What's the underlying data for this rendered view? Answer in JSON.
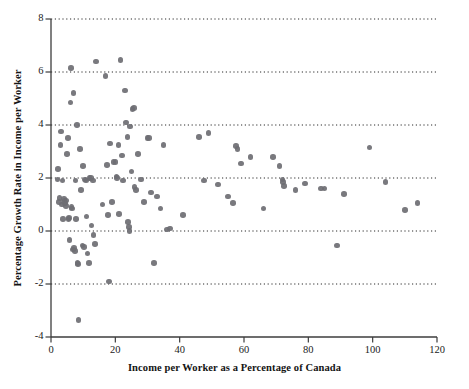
{
  "chart_data": {
    "type": "scatter",
    "title": "",
    "xlabel": "Income per Worker as a Percentage of Canada",
    "ylabel": "Percentage Growth Rate in Income per Worker",
    "xlim": [
      0,
      120
    ],
    "ylim": [
      -4,
      8
    ],
    "xticks": [
      0,
      20,
      40,
      60,
      80,
      100,
      120
    ],
    "yticks": [
      -4,
      -2,
      0,
      2,
      4,
      6,
      8
    ],
    "xtick_labels": [
      "0",
      "20",
      "40",
      "60",
      "80",
      "100",
      "120"
    ],
    "ytick_labels": [
      "-4",
      "-2",
      "0",
      "2",
      "4",
      "6",
      "8"
    ],
    "grid": "horizontal dotted gridlines at y = -2, 0, 2, 4, 6, 8",
    "gridlines": [
      -2,
      0,
      2,
      4,
      6,
      8
    ],
    "legend": null,
    "marker_color": "#6e6e73",
    "axis_color": "#3c3c3c",
    "points": [
      [
        2.0,
        1.95
      ],
      [
        2.2,
        2.35
      ],
      [
        2.5,
        1.1
      ],
      [
        2.6,
        1.25
      ],
      [
        3.0,
        3.25
      ],
      [
        3.2,
        3.75
      ],
      [
        3.4,
        1.0
      ],
      [
        3.6,
        1.9
      ],
      [
        3.8,
        0.45
      ],
      [
        4.0,
        1.2
      ],
      [
        4.2,
        1.15
      ],
      [
        4.4,
        1.05
      ],
      [
        4.6,
        0.95
      ],
      [
        4.8,
        1.15
      ],
      [
        5.0,
        2.9
      ],
      [
        5.2,
        3.5
      ],
      [
        5.4,
        0.45
      ],
      [
        5.6,
        0.5
      ],
      [
        5.8,
        -0.35
      ],
      [
        6.0,
        4.85
      ],
      [
        6.2,
        6.15
      ],
      [
        6.4,
        0.9
      ],
      [
        6.6,
        0.85
      ],
      [
        6.8,
        -0.7
      ],
      [
        7.0,
        5.2
      ],
      [
        7.2,
        -0.65
      ],
      [
        7.4,
        -0.75
      ],
      [
        7.6,
        1.9
      ],
      [
        7.8,
        0.45
      ],
      [
        8.0,
        4.0
      ],
      [
        8.2,
        -1.2
      ],
      [
        8.4,
        -1.25
      ],
      [
        8.6,
        -3.35
      ],
      [
        9.0,
        3.1
      ],
      [
        9.4,
        1.55
      ],
      [
        9.8,
        -0.55
      ],
      [
        10.0,
        2.45
      ],
      [
        10.2,
        -0.6
      ],
      [
        10.6,
        1.95
      ],
      [
        10.8,
        1.9
      ],
      [
        11.0,
        0.55
      ],
      [
        11.4,
        -0.85
      ],
      [
        11.8,
        -1.2
      ],
      [
        12.0,
        2.0
      ],
      [
        12.4,
        2.0
      ],
      [
        12.6,
        0.2
      ],
      [
        13.0,
        1.9
      ],
      [
        13.2,
        -0.15
      ],
      [
        13.6,
        -0.5
      ],
      [
        14.0,
        6.4
      ],
      [
        16.0,
        1.0
      ],
      [
        17.0,
        5.85
      ],
      [
        17.4,
        2.5
      ],
      [
        17.8,
        0.6
      ],
      [
        18.0,
        -1.9
      ],
      [
        18.4,
        3.3
      ],
      [
        19.0,
        1.1
      ],
      [
        19.4,
        2.6
      ],
      [
        20.0,
        2.6
      ],
      [
        20.4,
        2.05
      ],
      [
        20.6,
        2.0
      ],
      [
        21.0,
        3.25
      ],
      [
        21.2,
        0.65
      ],
      [
        21.6,
        6.45
      ],
      [
        22.0,
        2.85
      ],
      [
        22.4,
        1.9
      ],
      [
        23.0,
        5.3
      ],
      [
        23.4,
        4.1
      ],
      [
        23.8,
        3.55
      ],
      [
        24.0,
        0.35
      ],
      [
        24.2,
        0.15
      ],
      [
        24.4,
        0.0
      ],
      [
        24.6,
        3.95
      ],
      [
        25.0,
        2.25
      ],
      [
        25.4,
        4.6
      ],
      [
        25.8,
        4.65
      ],
      [
        26.0,
        1.65
      ],
      [
        26.4,
        1.55
      ],
      [
        27.0,
        2.9
      ],
      [
        28.0,
        1.95
      ],
      [
        29.0,
        1.1
      ],
      [
        30.0,
        3.5
      ],
      [
        30.4,
        3.5
      ],
      [
        31.0,
        1.45
      ],
      [
        32.0,
        -1.2
      ],
      [
        33.0,
        1.3
      ],
      [
        34.0,
        0.85
      ],
      [
        35.0,
        3.25
      ],
      [
        36.0,
        0.05
      ],
      [
        37.0,
        0.1
      ],
      [
        41.0,
        0.6
      ],
      [
        46.0,
        3.55
      ],
      [
        47.5,
        1.9
      ],
      [
        49.0,
        3.7
      ],
      [
        52.0,
        1.75
      ],
      [
        55.0,
        1.3
      ],
      [
        56.5,
        1.05
      ],
      [
        57.5,
        3.2
      ],
      [
        58.0,
        3.1
      ],
      [
        59.0,
        2.55
      ],
      [
        62.0,
        2.8
      ],
      [
        66.0,
        0.85
      ],
      [
        69.0,
        2.8
      ],
      [
        71.0,
        2.45
      ],
      [
        72.0,
        1.95
      ],
      [
        72.2,
        1.85
      ],
      [
        72.4,
        1.7
      ],
      [
        76.0,
        1.55
      ],
      [
        79.0,
        1.8
      ],
      [
        84.0,
        1.6
      ],
      [
        85.0,
        1.6
      ],
      [
        89.0,
        -0.55
      ],
      [
        91.0,
        1.4
      ],
      [
        99.0,
        3.15
      ],
      [
        104.0,
        1.85
      ],
      [
        110.0,
        0.8
      ],
      [
        114.0,
        1.05
      ]
    ],
    "n_points": 118
  }
}
